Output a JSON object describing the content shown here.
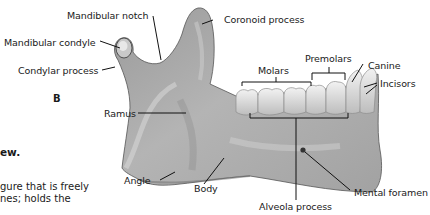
{
  "figure": {
    "panel_letter": "B",
    "labels": {
      "mandibular_notch": "Mandibular notch",
      "coronoid_process": "Coronoid process",
      "mandibular_condyle": "Mandibular condyle",
      "condylar_process": "Condylar process",
      "ramus": "Ramus",
      "molars": "Molars",
      "premolars": "Premolars",
      "canine": "Canine",
      "incisors": "Incisors",
      "angle": "Angle",
      "body": "Body",
      "alveolar_process": "Alveola  process",
      "mental_foramen": "Mental foramen"
    },
    "colors": {
      "bone_fill": "#a9a9a9",
      "bone_shadow": "#7d7d7d",
      "bone_highlight": "#dcdcdc",
      "teeth": "#e6e6e6",
      "leader_line": "#111111",
      "background": "#ffffff"
    }
  },
  "side_text": {
    "heading_fragment": "ew.",
    "body_line_1": "gure that is freely",
    "body_line_2": "nes; holds the"
  }
}
